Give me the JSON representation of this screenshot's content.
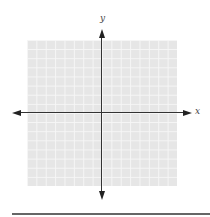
{
  "diagram": {
    "type": "coordinate-plane",
    "axes": {
      "x_label": "x",
      "y_label": "y"
    },
    "grid": {
      "columns": 16,
      "rows": 16,
      "fill_color": "#e6e6e6",
      "line_color": "#f6f6f6"
    },
    "axis_color": "#333333",
    "answer_line_color": "#666666"
  }
}
